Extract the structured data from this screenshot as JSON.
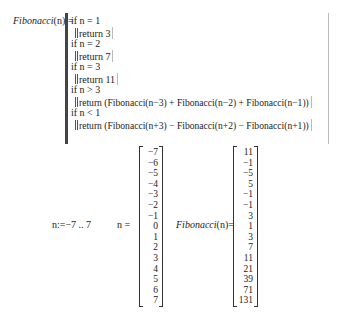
{
  "definition": {
    "function_name": "Fibonacci",
    "argument": "(n)",
    "assign_op": ":=",
    "lines": [
      {
        "kind": "if",
        "text": "if n = 1"
      },
      {
        "kind": "return",
        "text": "return 3"
      },
      {
        "kind": "if",
        "text": "if n = 2"
      },
      {
        "kind": "return",
        "text": "return 7"
      },
      {
        "kind": "if",
        "text": "if n = 3"
      },
      {
        "kind": "return",
        "text": "return 11"
      },
      {
        "kind": "if",
        "text": "if n > 3"
      },
      {
        "kind": "return",
        "text": "return (Fibonacci(n−3) + Fibonacci(n−2) + Fibonacci(n−1))"
      },
      {
        "kind": "if",
        "text": "if n < 1"
      },
      {
        "kind": "return",
        "text": "return (Fibonacci(n+3) − Fibonacci(n+2) − Fibonacci(n+1))"
      }
    ]
  },
  "range_definition": {
    "variable": "n",
    "assign_op": ":=",
    "range": "−7 .. 7"
  },
  "n_eval": {
    "label": "n =",
    "values": [
      "−7",
      "−6",
      "−5",
      "−4",
      "−3",
      "−2",
      "−1",
      "0",
      "1",
      "2",
      "3",
      "4",
      "5",
      "6",
      "7"
    ]
  },
  "fib_eval": {
    "function_name": "Fibonacci",
    "argument": "(n)",
    "equals": "=",
    "values": [
      "11",
      "−1",
      "−5",
      "5",
      "−1",
      "−1",
      "3",
      "1",
      "3",
      "7",
      "11",
      "21",
      "39",
      "71",
      "131"
    ]
  }
}
